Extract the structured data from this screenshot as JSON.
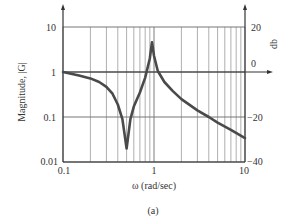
{
  "chart_data": {
    "type": "line",
    "title": "",
    "caption": "(a)",
    "xlabel": "ω (rad/sec)",
    "ylabel": "Magnitude, |G|",
    "ylabel_right": "db",
    "xscale": "log",
    "yscale": "log",
    "xlim": [
      0.1,
      10
    ],
    "ylim": [
      0.01,
      10
    ],
    "ylim_right_db": [
      -40,
      20
    ],
    "x_ticks": [
      "0.1",
      "1",
      "10"
    ],
    "y_ticks": [
      "0.01",
      "0.1",
      "1",
      "10"
    ],
    "y_ticks_right": [
      "−40",
      "−20",
      "0",
      "20"
    ],
    "grid": true,
    "legend": null,
    "series": [
      {
        "name": "|G|",
        "x": [
          0.1,
          0.15,
          0.2,
          0.25,
          0.3,
          0.35,
          0.4,
          0.45,
          0.5,
          0.55,
          0.6,
          0.7,
          0.8,
          0.9,
          0.95,
          1.0,
          1.1,
          1.3,
          1.6,
          2.0,
          3.0,
          4.0,
          5.0,
          7.0,
          10.0
        ],
        "values": [
          1.0,
          0.84,
          0.72,
          0.6,
          0.47,
          0.33,
          0.19,
          0.09,
          0.02,
          0.09,
          0.17,
          0.35,
          0.75,
          2.0,
          4.6,
          2.3,
          1.05,
          0.6,
          0.38,
          0.25,
          0.14,
          0.1,
          0.075,
          0.052,
          0.034
        ]
      }
    ]
  }
}
